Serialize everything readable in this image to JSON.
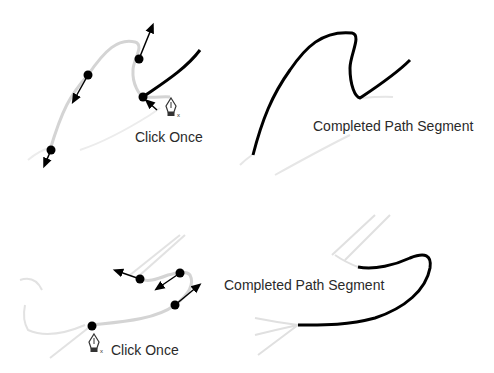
{
  "panels": [
    {
      "id": "top-left",
      "label": "Click Once",
      "description": "Pen tool clicking on anchor point to continue path"
    },
    {
      "id": "top-right",
      "label": "Completed Path Segment"
    },
    {
      "id": "bottom-left",
      "label": "Click Once"
    },
    {
      "id": "bottom-right",
      "label": "Completed Path Segment"
    }
  ],
  "colors": {
    "guide": "#d0d0d0",
    "path": "#000000",
    "text": "#2a2a2a"
  }
}
